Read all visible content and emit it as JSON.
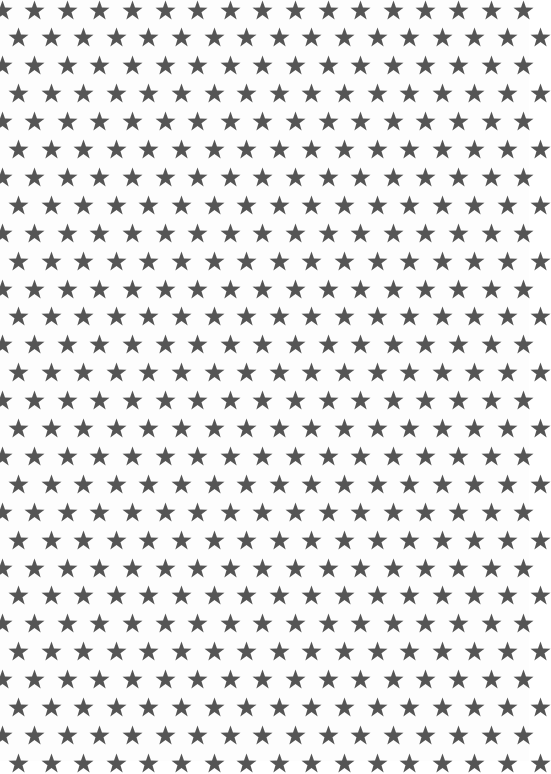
{
  "pattern": {
    "description": "Star pattern background",
    "icon": "star-icon",
    "background_color": "#fdfdfd",
    "star_color": "#555555",
    "star_size": 21,
    "column_spacing": 32.6,
    "row_spacing": 27.9,
    "first_row_y": 10,
    "first_row_x": 2,
    "offset_row_x": 18.5,
    "rows": 28,
    "columns": 17
  }
}
